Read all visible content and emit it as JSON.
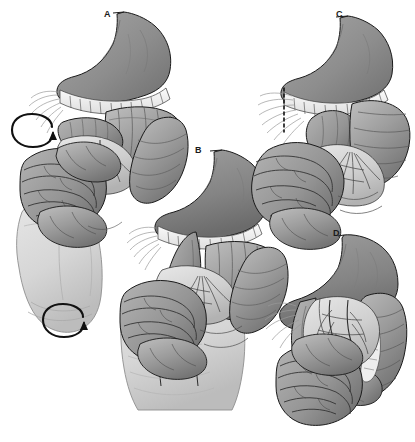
{
  "figure": {
    "kind": "medical-illustration",
    "style": "grayscale-line-and-tone",
    "background_color": "#ffffff",
    "width": 415,
    "height": 442,
    "panel_count": 4
  },
  "palette": {
    "background": "#ffffff",
    "outline": "#1a1a1a",
    "stomach_tone": "#8d8d8d",
    "stomach_shadow": "#6e6e6e",
    "stomach_highlight": "#a8a8a8",
    "bowel_tone": "#9a9a9a",
    "bowel_shadow": "#717171",
    "bowel_highlight": "#bdbdbd",
    "mesentery_tone": "#c9c9c9",
    "mesentery_light": "#e4e4e4",
    "hand_tone": "#d9d9d9",
    "hand_shadow": "#bcbcbc",
    "band_white": "#f4f4f4",
    "vessel_tone": "#5f5f5f",
    "label_color": "#1a1a1a"
  },
  "panels": [
    {
      "id": "a",
      "label": "A",
      "label_position": {
        "x": 104,
        "y": 9
      },
      "description": "Surgeon's hand elevates the midgut; paired rotation arrows indicate counterclockwise derotation of the volvulus.",
      "structures": [
        "esophagus",
        "stomach",
        "transverse-colon",
        "duodenum",
        "small-bowel-loops",
        "mesentery",
        "surgeons-hand"
      ],
      "annotations": [
        "rotation-arrow-upper",
        "rotation-arrow-lower"
      ]
    },
    {
      "id": "b",
      "label": "B",
      "label_position": {
        "x": 195,
        "y": 145
      },
      "description": "Two fingers spread the mesenteric root to expose and broaden the base after derotation.",
      "structures": [
        "esophagus",
        "stomach",
        "transverse-colon",
        "duodenum",
        "small-bowel-loops",
        "mesentery",
        "surgeons-fingers"
      ],
      "annotations": []
    },
    {
      "id": "c",
      "label": "C",
      "label_position": {
        "x": 336,
        "y": 9
      },
      "description": "Dashed line marks the division of the peritoneal (Ladd's) bands crossing the duodenum.",
      "structures": [
        "esophagus",
        "stomach",
        "transverse-colon",
        "duodenum",
        "small-bowel-loops",
        "ladds-bands"
      ],
      "annotations": [
        "dashed-incision-line"
      ]
    },
    {
      "id": "d",
      "label": "D",
      "label_position": {
        "x": 333,
        "y": 228
      },
      "description": "Final position: duodenum straightened to the right, colon placed to the left, broad mesenteric base.",
      "structures": [
        "esophagus",
        "stomach",
        "duodenum",
        "colon",
        "small-bowel-loops",
        "mesenteric-vessels"
      ],
      "annotations": []
    }
  ],
  "annotations": {
    "rotation_arrow_upper": {
      "name": "rotation-arrow-upper",
      "shape": "circular-loop-arrow",
      "center": {
        "x": 33,
        "y": 133
      },
      "rx": 20,
      "ry": 9
    },
    "rotation_arrow_lower": {
      "name": "rotation-arrow-lower",
      "shape": "circular-loop-arrow",
      "center": {
        "x": 64,
        "y": 323
      },
      "rx": 20,
      "ry": 9
    },
    "dashed_incision_line": {
      "name": "dashed-incision-line",
      "shape": "vertical-dashed",
      "x": 284,
      "y_top": 88,
      "y_bottom": 130,
      "dash": "3,3"
    }
  }
}
